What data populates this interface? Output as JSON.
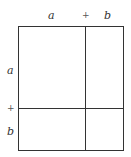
{
  "diagram": {
    "top_labels": {
      "a": "a",
      "plus": "+",
      "b": "b"
    },
    "side_labels": {
      "a": "a",
      "plus": "+",
      "b": "b"
    },
    "colors": {
      "line": "#333333",
      "background": "#ffffff"
    }
  }
}
